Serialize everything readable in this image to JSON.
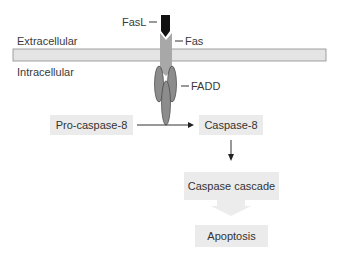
{
  "diagram": {
    "regions": {
      "extracellular": "Extracellular",
      "intracellular": "Intracellular"
    },
    "molecules": {
      "fasl": "FasL",
      "fas": "Fas",
      "fadd": "FADD"
    },
    "nodes": {
      "pro_caspase_8": "Pro-caspase-8",
      "caspase_8": "Caspase-8",
      "caspase_cascade": "Caspase cascade",
      "apoptosis": "Apoptosis"
    },
    "edges": [
      {
        "from": "Pro-caspase-8",
        "to": "Caspase-8",
        "type": "arrow"
      },
      {
        "from": "Caspase-8",
        "to": "Caspase cascade",
        "type": "arrow"
      },
      {
        "from": "Caspase cascade",
        "to": "Apoptosis",
        "type": "block-arrow"
      }
    ],
    "colors": {
      "fasl": "#111111",
      "fas": "#a8a8a8",
      "fadd": "#8c8c8c",
      "membrane": "#e4e4e4",
      "box": "#ebebeb"
    }
  }
}
